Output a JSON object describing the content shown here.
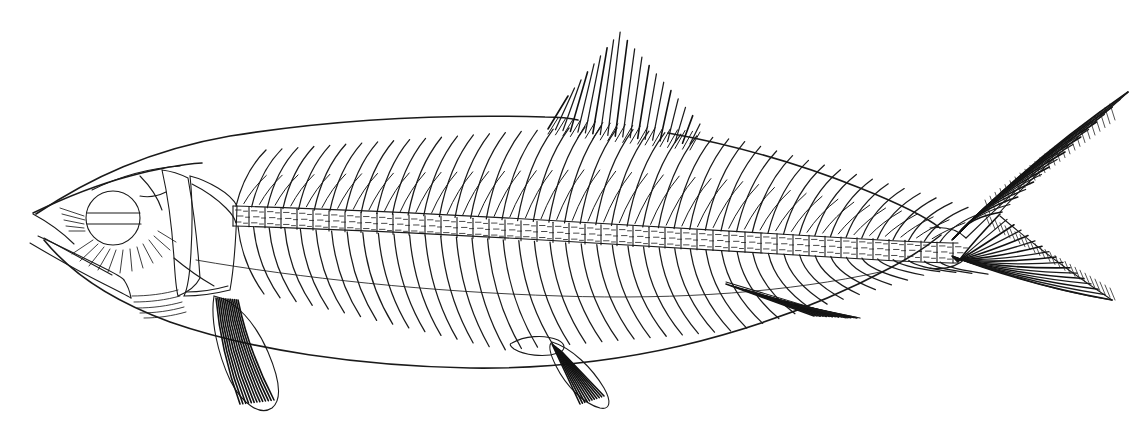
{
  "document": {
    "kind": "anatomical-engraving",
    "subject": "fish-skeleton",
    "common_name": "Herring",
    "orientation": "left-facing lateral view",
    "background_color": "#ffffff",
    "ink_color": "#1a1a1a",
    "width_px": 1142,
    "height_px": 438,
    "has_text_labels": false,
    "caption": ""
  },
  "anatomy": {
    "head": {
      "label": "Head",
      "snout_tip": [
        33,
        213
      ],
      "eye": {
        "label": "Eye",
        "cx": 113,
        "cy": 218,
        "r": 27,
        "band_y": 222
      },
      "upper_jaw": "maxilla",
      "lower_jaw": "mandible",
      "opercle": "opercular plate",
      "preopercle": "preopercular plate",
      "gill_rays_count": 14
    },
    "vertebral_column": {
      "label": "Vertebral column",
      "vertebra_count": 52,
      "start_x": 233,
      "end_x": 960,
      "segment_width_px": 16
    },
    "neural_spines": {
      "label": "Neural spines",
      "count": 46,
      "direction": "up-and-back"
    },
    "hemal_spines_ribs": {
      "label": "Ribs and hemal spines",
      "count": 46,
      "direction": "down-and-back"
    },
    "fins": [
      {
        "name": "dorsal-fin",
        "label": "Dorsal fin",
        "apex": [
          620,
          32
        ],
        "ray_count": 20,
        "shape": "triangular sail"
      },
      {
        "name": "caudal-fin",
        "label": "Caudal fin",
        "tip_upper": [
          1128,
          92
        ],
        "tip_lower": [
          1112,
          300
        ],
        "shape": "deeply forked",
        "ray_count": 34
      },
      {
        "name": "anal-fin",
        "label": "Anal fin",
        "origin": [
          748,
          292
        ],
        "ray_count": 16,
        "shape": "backswept triangle"
      },
      {
        "name": "pectoral-fin",
        "label": "Pectoral fin",
        "origin": [
          222,
          300
        ],
        "ray_count": 13,
        "shape": "elongate paddle"
      },
      {
        "name": "pelvic-fin",
        "label": "Pelvic fin",
        "origin": [
          548,
          345
        ],
        "ray_count": 11,
        "shape": "small lobe with bony loop"
      }
    ],
    "body_outline": {
      "label": "Body outline",
      "dorsal_profile": "rises from snout, peaks near dorsal fin, tapers to peduncle",
      "ventral_profile": "shallow curve from jaw to anal fin",
      "peduncle_x": 935
    }
  },
  "chart_data": {
    "type": "diagram",
    "elements": [
      "head",
      "eye",
      "jaw",
      "opercle",
      "vertebral column",
      "neural spines",
      "ribs",
      "dorsal fin",
      "pectoral fin",
      "pelvic fin",
      "anal fin",
      "caudal fin"
    ]
  }
}
